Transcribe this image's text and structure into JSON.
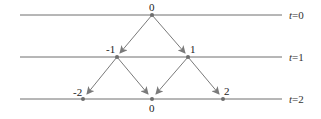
{
  "diagram": {
    "type": "binomial-tree / random walk",
    "colors": {
      "line": "#6e6e6e",
      "arrow": "#7a7a7a",
      "node": "#6e6e6e",
      "text": "#222222"
    },
    "time_levels": [
      {
        "label_var": "t",
        "label_eq": "=0",
        "y": 15
      },
      {
        "label_var": "t",
        "label_eq": "=1",
        "y": 57
      },
      {
        "label_var": "t",
        "label_eq": "=2",
        "y": 99
      }
    ],
    "nodes": [
      {
        "id": "n0",
        "level": 0,
        "value": "0",
        "x": 152,
        "y": 15,
        "label_pos": "above"
      },
      {
        "id": "n1m",
        "level": 1,
        "value": "-1",
        "x": 117,
        "y": 57,
        "label_pos": "above-left"
      },
      {
        "id": "n1p",
        "level": 1,
        "value": "1",
        "x": 188,
        "y": 57,
        "label_pos": "above-right"
      },
      {
        "id": "n2m",
        "level": 2,
        "value": "-2",
        "x": 83,
        "y": 99,
        "label_pos": "above-left"
      },
      {
        "id": "n2z",
        "level": 2,
        "value": "0",
        "x": 152,
        "y": 99,
        "label_pos": "below"
      },
      {
        "id": "n2p",
        "level": 2,
        "value": "2",
        "x": 223,
        "y": 99,
        "label_pos": "above-right"
      }
    ],
    "edges": [
      {
        "from": "n0",
        "to": "n1m"
      },
      {
        "from": "n0",
        "to": "n1p"
      },
      {
        "from": "n1m",
        "to": "n2m"
      },
      {
        "from": "n1m",
        "to": "n2z"
      },
      {
        "from": "n1p",
        "to": "n2z"
      },
      {
        "from": "n1p",
        "to": "n2p"
      }
    ]
  }
}
